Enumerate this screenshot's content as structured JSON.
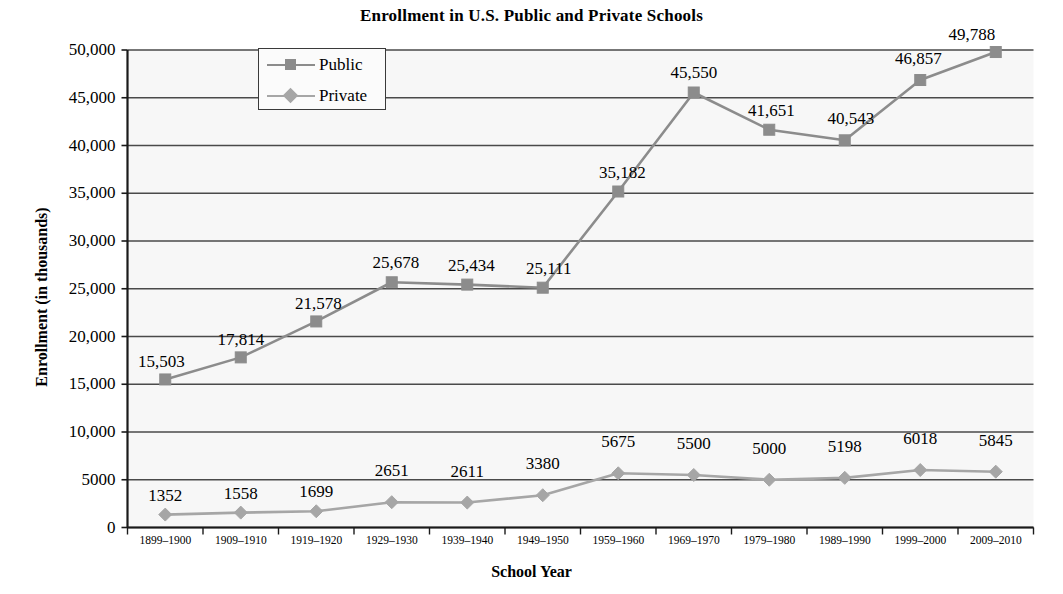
{
  "chart_data": {
    "type": "line",
    "title": "Enrollment in U.S. Public and Private Schools",
    "xlabel": "School Year",
    "ylabel": "Enrollment (in thousands)",
    "categories": [
      "1899–1900",
      "1909–1910",
      "1919–1920",
      "1929–1930",
      "1939–1940",
      "1949–1950",
      "1959–1960",
      "1969–1970",
      "1979–1980",
      "1989–1990",
      "1999–2000",
      "2009–2010"
    ],
    "series": [
      {
        "name": "Public",
        "marker": "square",
        "color": "#8c8c8c",
        "values": [
          15503,
          17814,
          21578,
          25678,
          25434,
          25111,
          35182,
          45550,
          41651,
          40543,
          46857,
          49788
        ],
        "labels": [
          "15,503",
          "17,814",
          "21,578",
          "25,678",
          "25,434",
          "25,111",
          "35,182",
          "45,550",
          "41,651",
          "40,543",
          "46,857",
          "49,788"
        ]
      },
      {
        "name": "Private",
        "marker": "diamond",
        "color": "#a6a6a6",
        "values": [
          1352,
          1558,
          1699,
          2651,
          2611,
          3380,
          5675,
          5500,
          5000,
          5198,
          6018,
          5845
        ],
        "labels": [
          "1352",
          "1558",
          "1699",
          "2651",
          "2611",
          "3380",
          "5675",
          "5500",
          "5000",
          "5198",
          "6018",
          "5845"
        ]
      }
    ],
    "ylim": [
      0,
      50000
    ],
    "yticks": [
      0,
      5000,
      10000,
      15000,
      20000,
      25000,
      30000,
      35000,
      40000,
      45000,
      50000
    ],
    "ytick_labels": [
      "0",
      "5000",
      "10,000",
      "15,000",
      "20,000",
      "25,000",
      "30,000",
      "35,000",
      "40,000",
      "45,000",
      "50,000"
    ],
    "grid": true,
    "legend_position": "top-left-inside",
    "legend_entries": [
      "Public",
      "Private"
    ],
    "plot_background": "#f7f7f7",
    "grid_color": "#4a4a4a",
    "axis_color": "#1a1a1a"
  }
}
